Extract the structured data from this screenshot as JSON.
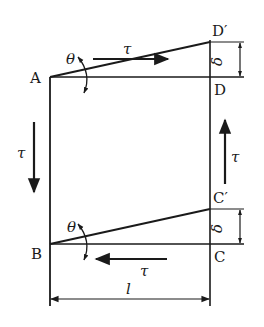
{
  "figure": {
    "colors": {
      "stroke": "#1a1a1a",
      "background": "#ffffff"
    },
    "points": {
      "A": "A",
      "B": "B",
      "C": "C",
      "D": "D",
      "C_prime": "C′",
      "D_prime": "D′"
    },
    "symbols": {
      "shear_stress_top": "τ",
      "shear_stress_bottom": "τ",
      "shear_stress_left": "τ",
      "shear_stress_right": "τ",
      "angle_top": "θ",
      "angle_bottom": "θ",
      "displacement_top": "δ",
      "displacement_bottom": "δ",
      "length": "l"
    }
  }
}
